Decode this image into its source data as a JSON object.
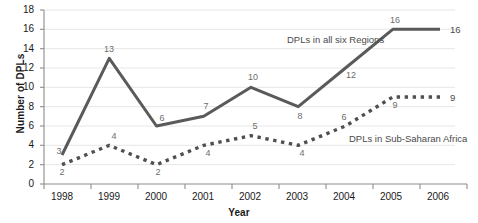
{
  "chart_data": {
    "type": "line",
    "title": "",
    "xlabel": "Year",
    "ylabel": "Number of DPLs",
    "categories": [
      "1998",
      "1999",
      "2000",
      "2001",
      "2002",
      "2003",
      "2004",
      "2005",
      "2006"
    ],
    "x": [
      1998,
      1999,
      2000,
      2001,
      2002,
      2003,
      2004,
      2005,
      2006
    ],
    "ylim": [
      0,
      18
    ],
    "xlim": [
      1998,
      2006
    ],
    "y_ticks": [
      "0",
      "2",
      "4",
      "6",
      "8",
      "10",
      "12",
      "14",
      "16",
      "18"
    ],
    "y_tick_values": [
      0,
      2,
      4,
      6,
      8,
      10,
      12,
      14,
      16,
      18
    ],
    "grid": "horizontal",
    "legend_position": "inline-annotation",
    "series": [
      {
        "name": "DPLs in all six Regions",
        "style": "solid",
        "color": "#5a5a5a",
        "values": [
          3,
          13,
          6,
          7,
          10,
          8,
          12,
          16,
          16
        ],
        "point_labels": [
          "3",
          "13",
          "6",
          "7",
          "10",
          "8",
          "12",
          "16",
          "16"
        ],
        "end_label": "16"
      },
      {
        "name": "DPLs in Sub-Saharan Africa",
        "style": "dotted",
        "color": "#4f4f4f",
        "values": [
          2,
          4,
          2,
          4,
          5,
          4,
          6,
          9,
          9
        ],
        "point_labels": [
          "2",
          "4",
          "2",
          "4",
          "5",
          "4",
          "6",
          "9",
          "9"
        ],
        "end_label": "9"
      }
    ],
    "annotations": [
      {
        "text": "DPLs in all six Regions",
        "series": "DPLs in all six Regions"
      },
      {
        "text": "DPLs in Sub-Saharan Africa",
        "series": "DPLs in Sub-Saharan Africa"
      }
    ],
    "colors": {
      "solid_series": "#5a5a5a",
      "dotted_series": "#4f4f4f",
      "gridline": "#e3e3e3",
      "axis": "#8c8c8c",
      "text": "#1a1a1a",
      "value_label": "#6d6d6d",
      "background": "#ffffff"
    }
  }
}
